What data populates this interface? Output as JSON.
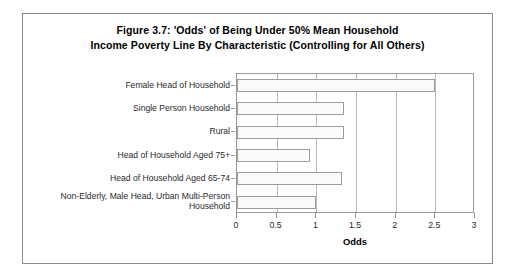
{
  "figure": {
    "title_line1": "Figure 3.7: 'Odds' of Being Under 50% Mean Household",
    "title_line2": "Income Poverty Line By Characteristic (Controlling for All Others)"
  },
  "chart_data": {
    "type": "bar",
    "orientation": "horizontal",
    "title": "Figure 3.7: 'Odds' of Being Under 50% Mean Household Income Poverty Line By Characteristic (Controlling for All Others)",
    "xlabel": "Odds",
    "ylabel": "",
    "xlim": [
      0,
      3
    ],
    "xticks": [
      0,
      0.5,
      1,
      1.5,
      2,
      2.5,
      3
    ],
    "xtick_labels": [
      "0",
      "0.5",
      "1",
      "1.5",
      "2",
      "2.5",
      "3"
    ],
    "grid": "vertical",
    "legend": "none",
    "categories": [
      "Female Head of Household",
      "Single Person Household",
      "Rural",
      "Head of Household Aged 75+",
      "Head of Household Aged 65-74",
      "Non-Elderly, Male Head, Urban Multi-Person Household"
    ],
    "category_lines": [
      [
        "Female Head of Household"
      ],
      [
        "Single Person Household"
      ],
      [
        "Rural"
      ],
      [
        "Head of Household Aged 75+"
      ],
      [
        "Head of Household Aged 65-74"
      ],
      [
        "Non-Elderly, Male Head, Urban Multi-Person",
        "Household"
      ]
    ],
    "values": [
      2.5,
      1.35,
      1.35,
      0.92,
      1.32,
      1.0
    ],
    "bar_fill": "#fbfbfb",
    "bar_border": "#9d9d9d"
  },
  "colors": {
    "frame": "#8a8a8a",
    "plot_border": "#9a9a9a",
    "gridline": "#b9b9b9",
    "text": "#1a1a1a",
    "background": "#ffffff"
  }
}
